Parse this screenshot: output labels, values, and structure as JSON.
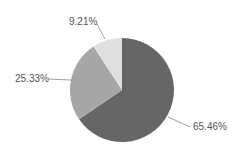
{
  "chart_data": {
    "type": "pie",
    "title": "",
    "start_angle_deg": 0,
    "direction": "clockwise",
    "legend": "none",
    "slices": [
      {
        "label": "65.46%",
        "value": 65.46,
        "color": "#666666"
      },
      {
        "label": "25.33%",
        "value": 25.33,
        "color": "#a6a6a6"
      },
      {
        "label": "9.21%",
        "value": 9.21,
        "color": "#e0e0e0"
      }
    ],
    "label_positions": [
      {
        "x": 193,
        "y": 130,
        "anchor": "start"
      },
      {
        "x": 15,
        "y": 82,
        "anchor": "start"
      },
      {
        "x": 69,
        "y": 25,
        "anchor": "start"
      }
    ],
    "leader_lines": [
      {
        "x1": 168,
        "y1": 117,
        "x2": 190,
        "y2": 127
      },
      {
        "x1": 71,
        "y1": 80,
        "x2": 48,
        "y2": 79
      },
      {
        "x1": 105,
        "y1": 39,
        "x2": 97,
        "y2": 24
      }
    ],
    "center": {
      "x": 122,
      "y": 90
    },
    "radius": 52
  }
}
